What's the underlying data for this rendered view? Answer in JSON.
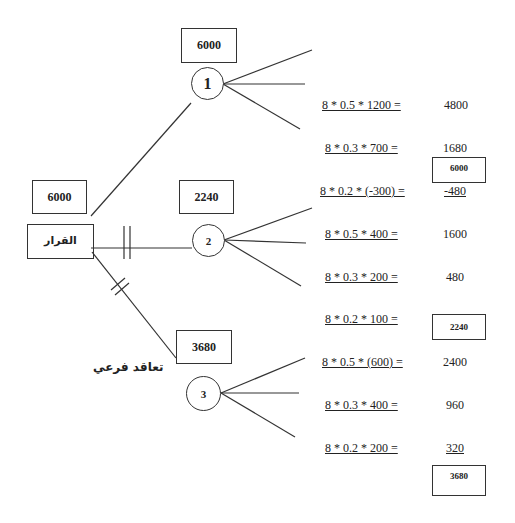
{
  "decision": {
    "label": "القرار",
    "value": "6000"
  },
  "subcontract_label": "تعاقد فرعي",
  "alternatives": [
    {
      "node": "1",
      "expected_value": "6000",
      "outcomes": [
        {
          "expression": "8 * 0.5 * 1200 =",
          "result": "4800"
        },
        {
          "expression": "8 * 0.3 * 700 =",
          "result": "1680"
        },
        {
          "expression": "8 * 0.2 * (-300) =",
          "result": "-480"
        }
      ],
      "total": "6000"
    },
    {
      "node": "2",
      "expected_value": "2240",
      "outcomes": [
        {
          "expression": "8 * 0.5 * 400 =",
          "result": "1600"
        },
        {
          "expression": "8 * 0.3 * 200 =",
          "result": "480"
        },
        {
          "expression": "8 * 0.2 * 100 =",
          "result": ""
        }
      ],
      "total": "2240"
    },
    {
      "node": "3",
      "expected_value": "3680",
      "outcomes": [
        {
          "expression": "8 * 0.5 * (600) =",
          "result": "2400"
        },
        {
          "expression": "8 * 0.3 * 400 =",
          "result": "960"
        },
        {
          "expression": "8 * 0.2 * 200 =",
          "result": "320"
        }
      ],
      "total": "3680"
    }
  ]
}
